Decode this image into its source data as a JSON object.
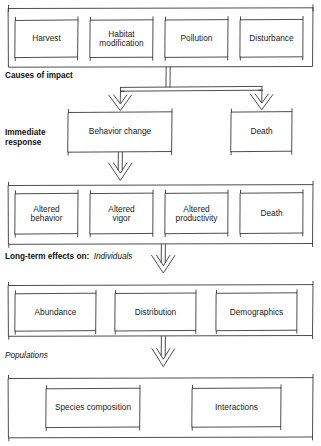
{
  "diagram": {
    "type": "flowchart",
    "stroke_color": "#3a3a3a",
    "text_color": "#1b1b1b",
    "background_color": "#ffffff",
    "tiers": [
      {
        "id": "causes",
        "label_bold": "Causes of impact",
        "label_italic": "",
        "nodes": [
          {
            "id": "harvest",
            "label": "Harvest"
          },
          {
            "id": "habitat-modification",
            "label": "Habitat\nmodification"
          },
          {
            "id": "pollution",
            "label": "Pollution"
          },
          {
            "id": "disturbance",
            "label": "Disturbance"
          }
        ]
      },
      {
        "id": "immediate-response",
        "label_bold": "Immediate\nresponse",
        "label_italic": "",
        "nodes": [
          {
            "id": "behavior-change",
            "label": "Behavior change"
          },
          {
            "id": "death-immediate",
            "label": "Death"
          }
        ]
      },
      {
        "id": "individuals",
        "label_bold": "Long-term effects on:",
        "label_italic": "Individuals",
        "nodes": [
          {
            "id": "altered-behavior",
            "label": "Altered\nbehavior"
          },
          {
            "id": "altered-vigor",
            "label": "Altered\nvigor"
          },
          {
            "id": "altered-productivity",
            "label": "Altered\nproductivity"
          },
          {
            "id": "death-longterm",
            "label": "Death"
          }
        ]
      },
      {
        "id": "populations",
        "label_bold": "",
        "label_italic": "Populations",
        "nodes": [
          {
            "id": "abundance",
            "label": "Abundance"
          },
          {
            "id": "distribution",
            "label": "Distribution"
          },
          {
            "id": "demographics",
            "label": "Demographics"
          }
        ]
      },
      {
        "id": "communities",
        "label_bold": "",
        "label_italic": "",
        "nodes": [
          {
            "id": "species-composition",
            "label": "Species composition"
          },
          {
            "id": "interactions",
            "label": "Interactions"
          }
        ]
      }
    ]
  }
}
